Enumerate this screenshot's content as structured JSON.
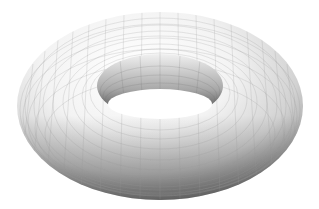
{
  "image": {
    "subject": "3D rendered torus with wireframe grid",
    "background": "#ffffff",
    "surface_colors": {
      "highlight": "#ffffff",
      "mid": "#d8d8d8",
      "shadow": "#7a7a7a",
      "grid": "#9a9a9a"
    },
    "grid": {
      "rings": 18,
      "meridians": 48
    }
  }
}
